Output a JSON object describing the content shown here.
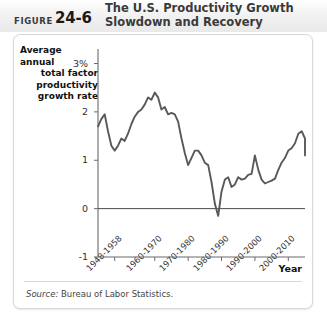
{
  "header": {
    "figure_word": "FIGURE",
    "figure_number": "24-6",
    "title_line1": "The U.S. Productivity Growth",
    "title_line2": "Slowdown and Recovery"
  },
  "source": {
    "label": "Source:",
    "text": " Bureau of Labor Statistics."
  },
  "chart_data": {
    "type": "line",
    "title": "The U.S. Productivity Growth Slowdown and Recovery",
    "ylabel": "Average annual total factor productivity growth rate",
    "ylabel_lines": [
      "Average annual",
      "total factor",
      "productivity",
      "growth rate"
    ],
    "xlabel": "Year",
    "ylim": [
      -1,
      3.3
    ],
    "yticks": [
      3,
      2,
      1,
      0,
      -1
    ],
    "ytick_labels": [
      "3%",
      "2",
      "1",
      "0",
      "-1"
    ],
    "xlim": [
      1948,
      2010
    ],
    "xtick_labels": [
      "1948-1958",
      "1960-1970",
      "1970-1980",
      "1980-1990",
      "1990-2000",
      "2000-2010"
    ],
    "xticks": [
      1953,
      1965,
      1975,
      1985,
      1995,
      2005
    ],
    "grid": false,
    "legend": "none",
    "zero_line": 0,
    "series": [
      {
        "name": "Average annual total factor productivity growth rate",
        "color": "#595959",
        "x": [
          1948,
          1949,
          1950,
          1951,
          1952,
          1953,
          1954,
          1955,
          1956,
          1957,
          1958,
          1959,
          1960,
          1961,
          1962,
          1963,
          1964,
          1965,
          1966,
          1967,
          1968,
          1969,
          1970,
          1971,
          1972,
          1973,
          1974,
          1975,
          1976,
          1977,
          1978,
          1979,
          1980,
          1981,
          1982,
          1983,
          1984,
          1985,
          1986,
          1987,
          1988,
          1989,
          1990,
          1991,
          1992,
          1993,
          1994,
          1995,
          1996,
          1997,
          1998,
          1999,
          2000,
          2001,
          2002,
          2003,
          2004,
          2005,
          2006,
          2007,
          2008,
          2009,
          2010
        ],
        "y": [
          1.7,
          1.85,
          1.95,
          1.6,
          1.3,
          1.2,
          1.3,
          1.45,
          1.4,
          1.55,
          1.75,
          1.9,
          2.0,
          2.05,
          2.15,
          2.3,
          2.25,
          2.4,
          2.3,
          2.05,
          2.1,
          1.95,
          1.98,
          1.95,
          1.8,
          1.45,
          1.15,
          0.9,
          1.05,
          1.2,
          1.2,
          1.1,
          0.95,
          0.9,
          0.55,
          0.1,
          -0.15,
          0.35,
          0.6,
          0.65,
          0.45,
          0.5,
          0.65,
          0.6,
          0.62,
          0.7,
          0.72,
          1.1,
          0.8,
          0.6,
          0.52,
          0.55,
          0.58,
          0.62,
          0.8,
          0.95,
          1.05,
          1.2,
          1.25,
          1.35,
          1.55,
          1.6,
          1.45
        ],
        "values_note": "Ends near 1.15 after a late dip from the 1.6 peak"
      }
    ],
    "series_tail": {
      "x": [
        2010,
        2011,
        2012
      ],
      "y": [
        1.45,
        1.1,
        1.18
      ]
    }
  }
}
